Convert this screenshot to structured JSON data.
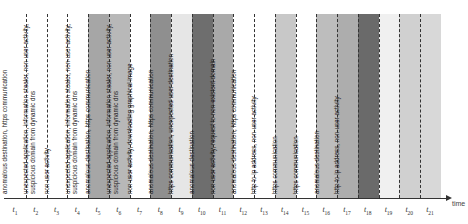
{
  "diagram": {
    "axis_label": "time",
    "columns": [
      {
        "t": "1",
        "label": "software update, anomalous destination",
        "color": "#ffffff"
      },
      {
        "t": "2",
        "label": "software update",
        "color": "#ffffff"
      },
      {
        "t": "3",
        "label": "anomalous destination, http to ip address, connect tunneling, server ip mismatch, https communication",
        "color": "#ffffff"
      },
      {
        "t": "4",
        "label": "anomalous destination, http to ip address, connect tunneling, https communication",
        "color": "#ffffff"
      },
      {
        "t": "5",
        "label": "anomalous destination, https communication",
        "color": "#a6a6a6"
      },
      {
        "t": "6",
        "label": "unexpected application, information stealer, non-user activity, suspicious domain from dynamic dns",
        "color": "#b8b8b8"
      },
      {
        "t": "7",
        "label": "non-user activity",
        "color": "#ffffff"
      },
      {
        "t": "8",
        "label": "unexpected application, information stealer, non-user activity, suspicious domain from dynamic dns",
        "color": "#8f8f8f"
      },
      {
        "t": "9",
        "label": "anomalous destination, https communication",
        "color": "#e6e6e6"
      },
      {
        "t": "10",
        "label": "unexpected application, information stealer, non-user activity, suspicious domain from dynamic dns",
        "color": "#6e6e6e"
      },
      {
        "t": "11",
        "label": "non-user activity, downloading graphical image",
        "color": "#a9a9a9"
      },
      {
        "t": "12",
        "label": "anomalous destination, https communication",
        "color": "#ffffff"
      },
      {
        "t": "13",
        "label": "https communication, unexpected user destination",
        "color": "#ffffff"
      },
      {
        "t": "14",
        "label": "anomalous destination",
        "color": "#c8c8c8"
      },
      {
        "t": "15",
        "label": "non-user activity, request to non-existent domain",
        "color": "#ffffff"
      },
      {
        "t": "16",
        "label": "anomalous destination, https communication",
        "color": "#bdbdbd"
      },
      {
        "t": "17",
        "label": "http to ip address, non-user activity",
        "color": "#adadad"
      },
      {
        "t": "18",
        "label": "https communication",
        "color": "#6a6a6a"
      },
      {
        "t": "19",
        "label": "https communication",
        "color": "#f0f0f0"
      },
      {
        "t": "20",
        "label": "anomalous destination",
        "color": "#d0d0d0"
      },
      {
        "t": "21",
        "label": "http to ip address, non-user activity",
        "color": "#d8d8d8"
      }
    ]
  }
}
